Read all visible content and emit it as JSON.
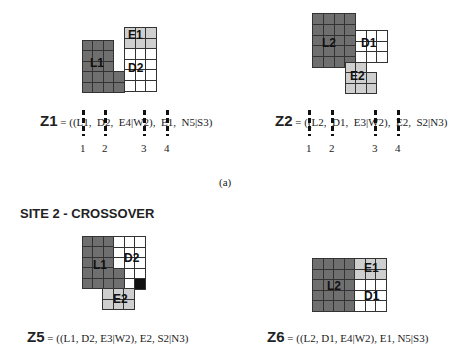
{
  "figures": {
    "z1": {
      "regions": [
        {
          "label": "E1",
          "shade": "light"
        },
        {
          "label": "L1",
          "shade": "dark"
        },
        {
          "label": "D2",
          "shade": "white"
        }
      ],
      "formula": {
        "name": "Z1",
        "prefix": " = ((",
        "tokens": [
          "L1,",
          "D2,",
          "E4|W2),",
          "E1,",
          "N5|S3)"
        ]
      },
      "cut_points": [
        "1",
        "2",
        "3",
        "4"
      ]
    },
    "z2": {
      "regions": [
        {
          "label": "L2",
          "shade": "dark"
        },
        {
          "label": "D1",
          "shade": "white"
        },
        {
          "label": "E2",
          "shade": "light"
        }
      ],
      "formula": {
        "name": "Z2",
        "prefix": " = ((",
        "tokens": [
          "L2,",
          "D1,",
          "E3|W2),",
          "E2,",
          "S2|N3)"
        ]
      },
      "cut_points": [
        "1",
        "2",
        "3",
        "4"
      ]
    },
    "z5": {
      "regions": [
        {
          "label": "L1",
          "shade": "dark"
        },
        {
          "label": "D2",
          "shade": "white"
        },
        {
          "label": "E2",
          "shade": "light"
        }
      ],
      "formula": {
        "name": "Z5",
        "text": " = ((L1,  D2,  E3|W2),  E2,  S2|N3)"
      }
    },
    "z6": {
      "regions": [
        {
          "label": "E1",
          "shade": "light"
        },
        {
          "label": "L2",
          "shade": "dark"
        },
        {
          "label": "D1",
          "shade": "white"
        }
      ],
      "formula": {
        "name": "Z6",
        "text": " = ((L2,  D1,  E4|W2),  E1,  N5|S3)"
      }
    }
  },
  "caption": "(a)",
  "section_title": "SITE 2 - CROSSOVER"
}
